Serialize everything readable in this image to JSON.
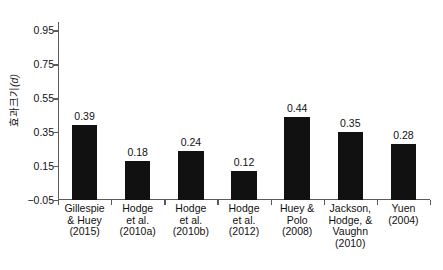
{
  "chart_data": {
    "type": "bar",
    "title": "",
    "subtitle": "",
    "xlabel": "",
    "ylabel": "효과크기(d)",
    "ylabel_plain": "효과크기",
    "ylabel_italic": "(d)",
    "categories": [
      "Gillespie & Huey (2015)",
      "Hodge et al. (2010a)",
      "Hodge et al. (2010b)",
      "Hodge et al. (2012)",
      "Huey & Polo (2008)",
      "Jackson, Hodge, & Vaughn (2010)",
      "Yuen (2004)"
    ],
    "category_lines": [
      [
        "Gillespie",
        "& Huey",
        "(2015)"
      ],
      [
        "Hodge",
        "et al.",
        "(2010a)"
      ],
      [
        "Hodge",
        "et al.",
        "(2010b)"
      ],
      [
        "Hodge",
        "et al.",
        "(2012)"
      ],
      [
        "Huey &",
        "Polo",
        "(2008)"
      ],
      [
        "Jackson,",
        "Hodge, &",
        "Vaughn",
        "(2010)"
      ],
      [
        "Yuen",
        "(2004)"
      ]
    ],
    "values": [
      0.39,
      0.18,
      0.24,
      0.12,
      0.44,
      0.35,
      0.28
    ],
    "value_labels": [
      "0.39",
      "0.18",
      "0.24",
      "0.12",
      "0.44",
      "0.35",
      "0.28"
    ],
    "ylim": [
      -0.05,
      1.0
    ],
    "yticks": [
      -0.05,
      0.15,
      0.35,
      0.55,
      0.75,
      0.95
    ],
    "ytick_labels": [
      "-0.05",
      "0.15",
      "0.35",
      "0.55",
      "0.75",
      "0.95"
    ],
    "grid": false,
    "legend": null,
    "bar_color": "#111111",
    "axis_color": "#5a5a5a",
    "background_color": "#ffffff"
  }
}
